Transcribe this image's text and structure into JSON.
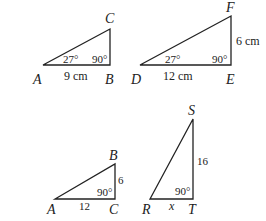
{
  "diagram": {
    "triangles": [
      {
        "id": "ABC_top",
        "vertices": {
          "A": "A",
          "B": "B",
          "C": "C"
        },
        "angle_A": "27°",
        "angle_B": "90°",
        "side_AB": "9 cm"
      },
      {
        "id": "DEF",
        "vertices": {
          "D": "D",
          "E": "E",
          "F": "F"
        },
        "angle_D": "27°",
        "angle_E": "90°",
        "side_DE": "12 cm",
        "side_EF": "6 cm"
      },
      {
        "id": "ABC_bottom",
        "vertices": {
          "A": "A",
          "B": "B",
          "C": "C"
        },
        "angle_C": "90°",
        "side_AC": "12",
        "side_BC": "6"
      },
      {
        "id": "RST",
        "vertices": {
          "R": "R",
          "S": "S",
          "T": "T"
        },
        "angle_T": "90°",
        "side_RT": "x",
        "side_ST": "16"
      }
    ],
    "colors": {
      "stroke": "#222222",
      "background": "#ffffff"
    }
  }
}
